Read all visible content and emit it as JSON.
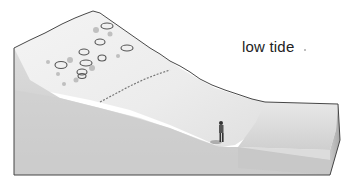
{
  "diagram": {
    "type": "block-diagram",
    "label": "low tide",
    "elements": [
      "rocky-seaweed-upper-shore",
      "strand-line",
      "sandy-beach-slope",
      "person-figure",
      "sea-water-block"
    ],
    "colors": {
      "outline": "#333333",
      "side_face": "#cfcfcf",
      "beach_surface": "#e9e9e9",
      "sea_top": "#d6d6d6",
      "sea_front": "#bdbdbd",
      "rocks": "#888888"
    }
  }
}
